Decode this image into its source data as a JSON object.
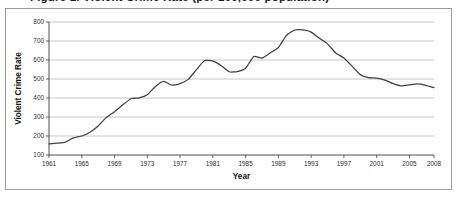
{
  "figure": {
    "title": "Figure 1. Violent Crime Rate (per 100,000 population)",
    "title_clipped": true,
    "frame_color": "#9a9a9a",
    "background": "#ffffff"
  },
  "chart_data": {
    "type": "line",
    "title": "Figure 1. Violent Crime Rate (per 100,000 population)",
    "xlabel": "Year",
    "ylabel": "Violent Crime Rate",
    "xlim": [
      1961,
      2008
    ],
    "ylim": [
      100,
      800
    ],
    "ytick_step": 100,
    "grid": "horizontal",
    "legend": "none",
    "line_color": "#404040",
    "xticks": [
      "1961",
      "1965",
      "1969",
      "1973",
      "1977",
      "1981",
      "1985",
      "1989",
      "1993",
      "1997",
      "2001",
      "2005",
      "2008"
    ],
    "yticks": [
      "100",
      "200",
      "300",
      "400",
      "500",
      "600",
      "700",
      "800"
    ],
    "series": [
      {
        "name": "Violent Crime Rate",
        "x": [
          1961,
          1962,
          1963,
          1964,
          1965,
          1966,
          1967,
          1968,
          1969,
          1970,
          1971,
          1972,
          1973,
          1974,
          1975,
          1976,
          1977,
          1978,
          1979,
          1980,
          1981,
          1982,
          1983,
          1984,
          1985,
          1986,
          1987,
          1988,
          1989,
          1990,
          1991,
          1992,
          1993,
          1994,
          1995,
          1996,
          1997,
          1998,
          1999,
          2000,
          2001,
          2002,
          2003,
          2004,
          2005,
          2006,
          2007,
          2008
        ],
        "values": [
          158,
          162,
          168,
          190,
          200,
          220,
          253,
          298,
          328,
          364,
          396,
          401,
          417,
          461,
          487,
          468,
          476,
          498,
          549,
          597,
          594,
          571,
          538,
          539,
          557,
          618,
          610,
          637,
          666,
          730,
          758,
          758,
          747,
          714,
          685,
          637,
          611,
          568,
          523,
          507,
          505,
          494,
          476,
          464,
          469,
          474,
          467,
          455
        ]
      }
    ],
    "annotations": {
      "start_value": 158,
      "start_year": 1961,
      "peak_value": 758,
      "peak_year": 1991,
      "end_value": 455,
      "end_year": 2008
    }
  },
  "axes": {
    "x_axis_label": "Year",
    "y_axis_label": "Violent Crime Rate"
  }
}
